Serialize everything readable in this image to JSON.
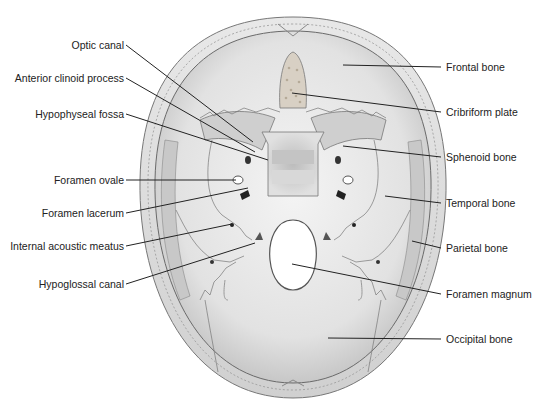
{
  "figure": {
    "colors": {
      "bone_light": "#f2f2f2",
      "bone_mid": "#d6d6d6",
      "bone_dark": "#a8a8a8",
      "outline": "#6a6a6a",
      "leader": "#222222",
      "text": "#222222"
    }
  },
  "labels": {
    "left": [
      {
        "id": "optic-canal",
        "text": "Optic canal",
        "x_right": 123,
        "y": 45,
        "tip": [
          253,
          142
        ]
      },
      {
        "id": "anterior-clinoid-process",
        "text": "Anterior clinoid process",
        "x_right": 123,
        "y": 78,
        "tip": [
          255,
          152
        ]
      },
      {
        "id": "hypophyseal-fossa",
        "text": "Hypophyseal fossa",
        "x_right": 123,
        "y": 114,
        "tip": [
          268,
          160
        ]
      },
      {
        "id": "foramen-ovale",
        "text": "Foramen ovale",
        "x_right": 123,
        "y": 180,
        "tip": [
          236,
          180
        ]
      },
      {
        "id": "foramen-lacerum",
        "text": "Foramen lacerum",
        "x_right": 123,
        "y": 213,
        "tip": [
          248,
          188
        ]
      },
      {
        "id": "internal-acoustic-meatus",
        "text": "Internal acoustic meatus",
        "x_right": 123,
        "y": 246,
        "tip": [
          232,
          224
        ]
      },
      {
        "id": "hypoglossal-canal",
        "text": "Hypoglossal canal",
        "x_right": 123,
        "y": 284,
        "tip": [
          255,
          243
        ]
      }
    ],
    "right": [
      {
        "id": "frontal-bone",
        "text": "Frontal bone",
        "x_left": 446,
        "y": 67,
        "tip": [
          343,
          65
        ]
      },
      {
        "id": "cribriform-plate",
        "text": "Cribriform plate",
        "x_left": 446,
        "y": 112,
        "tip": [
          292,
          93
        ]
      },
      {
        "id": "sphenoid-bone",
        "text": "Sphenoid bone",
        "x_left": 446,
        "y": 157,
        "tip": [
          343,
          146
        ]
      },
      {
        "id": "temporal-bone",
        "text": "Temporal bone",
        "x_left": 446,
        "y": 203,
        "tip": [
          385,
          196
        ]
      },
      {
        "id": "parietal-bone",
        "text": "Parietal bone",
        "x_left": 446,
        "y": 248,
        "tip": [
          412,
          241
        ]
      },
      {
        "id": "foramen-magnum",
        "text": "Foramen magnum",
        "x_left": 446,
        "y": 294,
        "tip": [
          292,
          264
        ]
      },
      {
        "id": "occipital-bone",
        "text": "Occipital bone",
        "x_left": 446,
        "y": 339,
        "tip": [
          328,
          338
        ]
      }
    ]
  }
}
